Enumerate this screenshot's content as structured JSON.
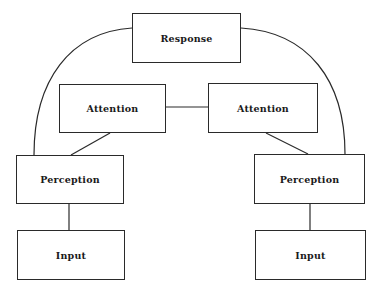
{
  "diagram": {
    "type": "flowchart",
    "nodes": [
      {
        "id": "response",
        "label": "Response",
        "x": 132,
        "y": 13,
        "w": 109,
        "h": 50
      },
      {
        "id": "attention_left",
        "label": "Attention",
        "x": 59,
        "y": 84,
        "w": 107,
        "h": 49
      },
      {
        "id": "attention_right",
        "label": "Attention",
        "x": 208,
        "y": 83,
        "w": 110,
        "h": 50
      },
      {
        "id": "perception_left",
        "label": "Perception",
        "x": 16,
        "y": 155,
        "w": 108,
        "h": 49
      },
      {
        "id": "perception_right",
        "label": "Perception",
        "x": 254,
        "y": 154,
        "w": 111,
        "h": 50
      },
      {
        "id": "input_left",
        "label": "Input",
        "x": 17,
        "y": 230,
        "w": 108,
        "h": 50
      },
      {
        "id": "input_right",
        "label": "Input",
        "x": 255,
        "y": 230,
        "w": 111,
        "h": 50
      }
    ],
    "edges": [
      {
        "from": "attention_left",
        "to": "attention_right",
        "shape": "straight"
      },
      {
        "from": "attention_left",
        "to": "perception_left",
        "shape": "straight"
      },
      {
        "from": "attention_right",
        "to": "perception_right",
        "shape": "straight"
      },
      {
        "from": "perception_left",
        "to": "input_left",
        "shape": "straight"
      },
      {
        "from": "perception_right",
        "to": "input_right",
        "shape": "straight"
      },
      {
        "from": "perception_left",
        "to": "response",
        "shape": "curve"
      },
      {
        "from": "perception_right",
        "to": "response",
        "shape": "curve"
      }
    ],
    "line_color": "#2a2a2a"
  }
}
